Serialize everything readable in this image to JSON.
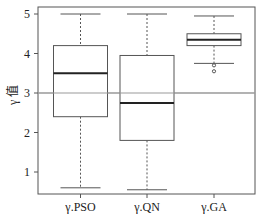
{
  "chart_data": {
    "type": "box",
    "title": "",
    "xlabel": "",
    "ylabel": "γ 值",
    "ylim": [
      0.3,
      5.2
    ],
    "yticks": [
      1,
      2,
      3,
      4,
      5
    ],
    "grid": false,
    "reference_line": {
      "y": 3,
      "color": "#999999"
    },
    "categories": [
      "γ.PSO",
      "γ.QN",
      "γ.GA"
    ],
    "series": [
      {
        "name": "γ.PSO",
        "whisker_low": 0.6,
        "q1": 2.4,
        "median": 3.5,
        "q3": 4.2,
        "whisker_high": 5.0,
        "outliers": []
      },
      {
        "name": "γ.QN",
        "whisker_low": 0.55,
        "q1": 1.8,
        "median": 2.75,
        "q3": 3.95,
        "whisker_high": 5.0,
        "outliers": []
      },
      {
        "name": "γ.GA",
        "whisker_low": 3.75,
        "q1": 4.2,
        "median": 4.35,
        "q3": 4.5,
        "whisker_high": 4.95,
        "outliers": [
          3.7,
          3.55
        ]
      }
    ]
  },
  "colors": {
    "frame": "#555555",
    "box": "#555555",
    "median": "#222222",
    "ref": "#999999",
    "text": "#222222"
  }
}
